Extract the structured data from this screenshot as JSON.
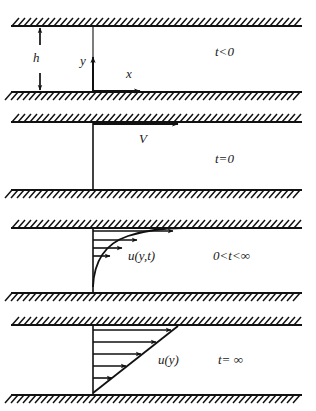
{
  "figure": {
    "type": "technical-diagram",
    "width": 316,
    "height": 411,
    "colors": {
      "line": "#111111",
      "background": "#ffffff",
      "text": "#1a1a1a"
    },
    "geometry": {
      "wall_left_x": 11,
      "wall_right_x": 302,
      "axis_x": 93,
      "hatch_length": 9,
      "hatch_spacing": 6
    },
    "panels": [
      {
        "id": "panel-t-lt-0",
        "time_label": "t<0",
        "time_label_x": 215,
        "time_label_y": 56,
        "top_wall_y": 26,
        "bottom_wall_y": 92,
        "annotations": {
          "gap_label": "h",
          "gap_label_x": 33,
          "gap_label_y": 62,
          "gap_arrow_x": 40,
          "y_axis_label": "y",
          "y_axis_label_x": 80,
          "y_axis_label_y": 65,
          "x_axis_label": "x",
          "x_axis_label_x": 126,
          "x_axis_label_y": 78
        },
        "profile": "none"
      },
      {
        "id": "panel-t-eq-0",
        "time_label": "t=0",
        "time_label_x": 215,
        "time_label_y": 163,
        "top_wall_y": 122,
        "bottom_wall_y": 190,
        "annotations": {
          "velocity_label": "V",
          "velocity_label_x": 139,
          "velocity_label_y": 143
        },
        "profile": "impulsive-start"
      },
      {
        "id": "panel-t-between",
        "time_label": "0<t<∞",
        "time_label_x": 213,
        "time_label_y": 260,
        "top_wall_y": 228,
        "bottom_wall_y": 293,
        "annotations": {
          "velocity_label": "u(y,t)",
          "velocity_label_x": 128,
          "velocity_label_y": 260
        },
        "profile": "transient-curved",
        "arrow_tips": [
          {
            "y": 234,
            "x": 173
          },
          {
            "y": 242,
            "x": 137
          },
          {
            "y": 250,
            "x": 122
          },
          {
            "y": 258,
            "x": 110
          }
        ]
      },
      {
        "id": "panel-t-inf",
        "time_label": "t= ∞",
        "time_label_x": 218,
        "time_label_y": 364,
        "top_wall_y": 325,
        "bottom_wall_y": 395,
        "annotations": {
          "velocity_label": "u(y)",
          "velocity_label_x": 158,
          "velocity_label_y": 364
        },
        "profile": "linear-steady",
        "arrow_tips": [
          {
            "y": 333,
            "x": 165
          },
          {
            "y": 344,
            "x": 148
          },
          {
            "y": 355,
            "x": 133
          },
          {
            "y": 366,
            "x": 120
          },
          {
            "y": 377,
            "x": 107
          }
        ]
      }
    ]
  }
}
